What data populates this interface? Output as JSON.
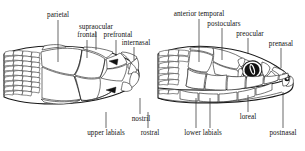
{
  "figure": {
    "views": [
      {
        "name": "dorsal-view",
        "description": "dorsal (top) view of snake head"
      },
      {
        "name": "lateral-view",
        "description": "lateral (side) view of snake head"
      }
    ],
    "ink_color": "#1a1a1a",
    "background_color": "#ffffff"
  },
  "labels": {
    "parietal": "parietal",
    "supraocular": "supraocular",
    "frontal": "frontal",
    "prefrontal": "prefrontal",
    "internasal": "internasal",
    "anterior_temporal": "anterior temporal",
    "postoculars": "postoculars",
    "preocular": "preocular",
    "prenasal": "prenasal",
    "upper_labials": "upper labials",
    "nostril": "nostril",
    "rostral": "rostral",
    "lower_labials": "lower labials",
    "loreal": "loreal",
    "postnasal": "postnasal"
  }
}
